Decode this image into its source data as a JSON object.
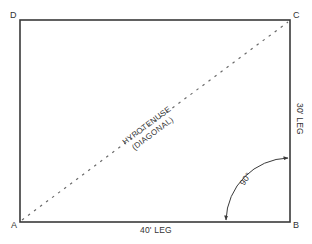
{
  "caption": "",
  "diagram": {
    "type": "right-triangle-layout",
    "colors": {
      "stroke": "#3a3a3a",
      "dash": "#6a6a6a",
      "text": "#333333"
    },
    "corners": {
      "A": "A",
      "B": "B",
      "C": "C",
      "D": "D"
    },
    "bottom_leg_label": "40' LEG",
    "right_leg_label": "30' LEG",
    "hypotenuse_label_line1": "HYPOTENUSE",
    "hypotenuse_label_line2": "(DIAGONAL)",
    "angle_label": "90°"
  }
}
